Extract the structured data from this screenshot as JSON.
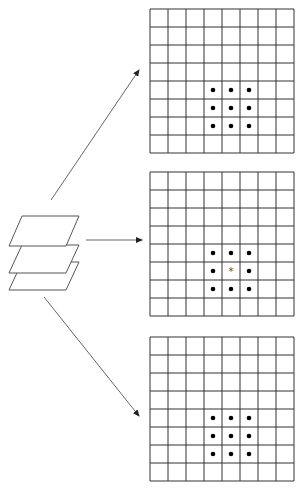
{
  "figure": {
    "type": "diagram",
    "stack": {
      "layers": 3,
      "icon": "stacked-layers-icon"
    },
    "arrows": [
      {
        "from": "stack",
        "to": "grid-top",
        "icon": "arrow-up-right-icon"
      },
      {
        "from": "stack",
        "to": "grid-middle",
        "icon": "arrow-right-icon"
      },
      {
        "from": "stack",
        "to": "grid-bottom",
        "icon": "arrow-down-right-icon"
      }
    ],
    "grids": [
      {
        "id": "grid-top",
        "rows": 8,
        "cols": 8,
        "marks": [
          [
            4,
            3,
            "dot"
          ],
          [
            4,
            4,
            "dot"
          ],
          [
            4,
            5,
            "dot"
          ],
          [
            5,
            3,
            "dot"
          ],
          [
            5,
            4,
            "dot"
          ],
          [
            5,
            5,
            "dot"
          ],
          [
            6,
            3,
            "dot"
          ],
          [
            6,
            4,
            "dot"
          ],
          [
            6,
            5,
            "dot"
          ]
        ]
      },
      {
        "id": "grid-middle",
        "rows": 8,
        "cols": 8,
        "marks": [
          [
            4,
            3,
            "dot"
          ],
          [
            4,
            4,
            "dot"
          ],
          [
            4,
            5,
            "dot"
          ],
          [
            5,
            3,
            "dot"
          ],
          [
            5,
            4,
            "asterisk"
          ],
          [
            5,
            5,
            "dot"
          ],
          [
            6,
            3,
            "dot"
          ],
          [
            6,
            4,
            "dot"
          ],
          [
            6,
            5,
            "dot"
          ]
        ]
      },
      {
        "id": "grid-bottom",
        "rows": 8,
        "cols": 8,
        "marks": [
          [
            4,
            3,
            "dot"
          ],
          [
            4,
            4,
            "dot"
          ],
          [
            4,
            5,
            "dot"
          ],
          [
            5,
            3,
            "dot"
          ],
          [
            5,
            4,
            "dot"
          ],
          [
            5,
            5,
            "dot"
          ],
          [
            6,
            3,
            "dot"
          ],
          [
            6,
            4,
            "dot"
          ],
          [
            6,
            5,
            "dot"
          ]
        ]
      }
    ],
    "center_symbol": "*",
    "colors": {
      "line": "#333333",
      "arrow": "#555555",
      "dot": "#000000",
      "asterisk": "#555555"
    }
  }
}
